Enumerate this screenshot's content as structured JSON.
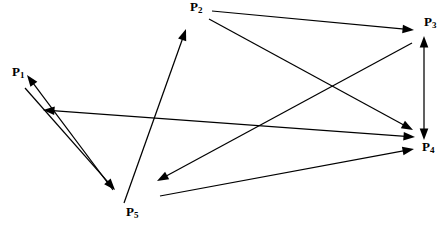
{
  "diagram": {
    "type": "directed-graph",
    "title": "",
    "width": 444,
    "height": 231,
    "background_color": "#ffffff",
    "line_color": "#000000",
    "nodes": [
      {
        "id": "P1",
        "base": "P",
        "sub": "1",
        "label": "P1",
        "x": 12,
        "y": 72,
        "anchor_x": 25,
        "anchor_y": 80
      },
      {
        "id": "P2",
        "base": "P",
        "sub": "2",
        "label": "P2",
        "x": 190,
        "y": 4,
        "anchor_x": 200,
        "anchor_y": 12
      },
      {
        "id": "P3",
        "base": "P",
        "sub": "3",
        "label": "P3",
        "x": 423,
        "y": 19,
        "anchor_x": 430,
        "anchor_y": 27
      },
      {
        "id": "P4",
        "base": "P",
        "sub": "4",
        "label": "P4",
        "x": 421,
        "y": 143,
        "anchor_x": 428,
        "anchor_y": 151
      },
      {
        "id": "P5",
        "base": "P",
        "sub": "5",
        "label": "P5",
        "x": 126,
        "y": 208,
        "anchor_x": 135,
        "anchor_y": 214
      }
    ],
    "edges": [
      {
        "id": "e1",
        "from": "P5",
        "to": "P1",
        "x1": 113,
        "y1": 190,
        "x2": 27,
        "y2": 75,
        "heads": "end"
      },
      {
        "id": "e2",
        "from": "P1",
        "to": "P5",
        "x1": 25,
        "y1": 88,
        "x2": 115,
        "y2": 190,
        "heads": "end"
      },
      {
        "id": "e3",
        "from": "P5",
        "to": "P2",
        "x1": 124,
        "y1": 203,
        "x2": 186,
        "y2": 29,
        "heads": "end"
      },
      {
        "id": "e4",
        "from": "P2",
        "to": "P3",
        "x1": 212,
        "y1": 11,
        "x2": 414,
        "y2": 30,
        "heads": "end"
      },
      {
        "id": "e5",
        "from": "P2",
        "to": "P4",
        "x1": 209,
        "y1": 19,
        "x2": 413,
        "y2": 130,
        "heads": "end"
      },
      {
        "id": "e6",
        "from": "P3",
        "to": "P5",
        "x1": 412,
        "y1": 43,
        "x2": 157,
        "y2": 181,
        "heads": "end"
      },
      {
        "id": "e7",
        "from": "P5",
        "to": "P4",
        "x1": 160,
        "y1": 196,
        "x2": 414,
        "y2": 149,
        "heads": "end"
      },
      {
        "id": "e8",
        "from": "P3",
        "to": "P4",
        "x1": 424,
        "y1": 36,
        "x2": 424,
        "y2": 140,
        "heads": "both"
      },
      {
        "id": "e9",
        "from": "P1",
        "to": "P4",
        "x1": 43,
        "y1": 110,
        "x2": 415,
        "y2": 137,
        "heads": "both"
      }
    ]
  }
}
